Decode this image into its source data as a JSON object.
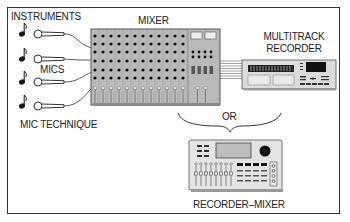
{
  "diagram": {
    "labels": {
      "instruments": "INSTRUMENTS",
      "mics": "MICS",
      "mic_technique": "MIC TECHNIQUE",
      "mixer": "MIXER",
      "multitrack_recorder_line1": "MULTITRACK",
      "multitrack_recorder_line2": "RECORDER",
      "or": "OR",
      "recorder_mixer": "RECORDER–MIXER"
    },
    "nodes": [
      {
        "id": "instruments",
        "label": "INSTRUMENTS",
        "count": 4,
        "icon": "music-note-icon"
      },
      {
        "id": "mics",
        "label": "MICS",
        "count": 4,
        "icon": "microphone-icon"
      },
      {
        "id": "mixer",
        "label": "MIXER",
        "channels": 12
      },
      {
        "id": "multitrack-recorder",
        "label": "MULTITRACK RECORDER"
      },
      {
        "id": "recorder-mixer",
        "label": "RECORDER–MIXER"
      }
    ],
    "edges": [
      {
        "from": "instruments",
        "to": "mics",
        "label": "MIC TECHNIQUE"
      },
      {
        "from": "mics",
        "to": "mixer"
      },
      {
        "from": "mixer",
        "to": "multitrack-recorder"
      },
      {
        "from": "mixer+multitrack-recorder",
        "to": "recorder-mixer",
        "label": "OR"
      }
    ],
    "colors": {
      "device_fill": "#b9b9b9",
      "device_light": "#e4e4e4",
      "outline": "#333333",
      "frame": "#333333"
    }
  }
}
